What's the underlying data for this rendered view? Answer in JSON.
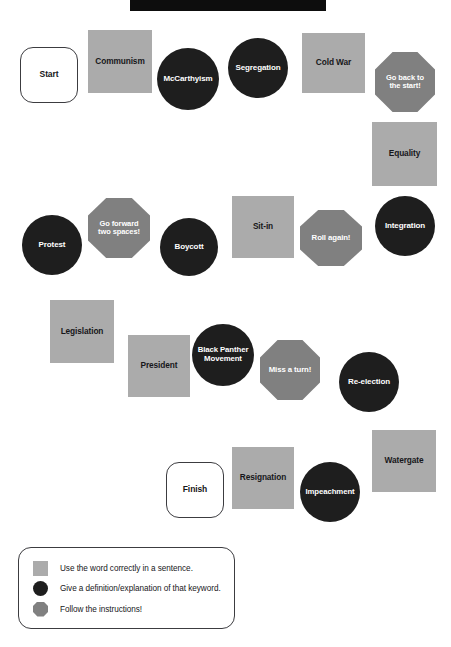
{
  "page": {
    "title_banner": {
      "name": "title-banner",
      "visible_text": ""
    },
    "background_color": "#ffffff"
  },
  "colors": {
    "square_fill": "#ababab",
    "circle_fill": "#1e1e1e",
    "octagon_fill": "#808080",
    "rounded_fill": "#ffffff",
    "outline": "#3c3c40",
    "banner": "#0d0d0d",
    "dark_text": "#17171a",
    "light_text": "#ffffff"
  },
  "board": {
    "spaces": [
      {
        "label": "Start",
        "shape": "rounded",
        "x": 20,
        "y": 47,
        "w": 58,
        "h": 56,
        "font": 8.5
      },
      {
        "label": "Communism",
        "shape": "square",
        "x": 88,
        "y": 30,
        "w": 64,
        "h": 63,
        "font": 8.3
      },
      {
        "label": "McCarthyism",
        "shape": "circle",
        "x": 157,
        "y": 48,
        "w": 62,
        "h": 62,
        "font": 8.0
      },
      {
        "label": "Segregation",
        "shape": "circle",
        "x": 228,
        "y": 38,
        "w": 60,
        "h": 60,
        "font": 8.0
      },
      {
        "label": "Cold War",
        "shape": "square",
        "x": 302,
        "y": 33,
        "w": 63,
        "h": 60,
        "font": 8.3
      },
      {
        "label": "Go back to\nthe start!",
        "shape": "octagon",
        "x": 375,
        "y": 52,
        "w": 60,
        "h": 60,
        "font": 7.5
      },
      {
        "label": "Equality",
        "shape": "square",
        "x": 372,
        "y": 122,
        "w": 65,
        "h": 64,
        "font": 8.3
      },
      {
        "label": "Integration",
        "shape": "circle",
        "x": 375,
        "y": 196,
        "w": 60,
        "h": 60,
        "font": 8.0
      },
      {
        "label": "Go forward\ntwo spaces!",
        "shape": "octagon",
        "x": 88,
        "y": 198,
        "w": 62,
        "h": 60,
        "font": 7.5
      },
      {
        "label": "Protest",
        "shape": "circle",
        "x": 22,
        "y": 215,
        "w": 60,
        "h": 60,
        "font": 8.0
      },
      {
        "label": "Boycott",
        "shape": "circle",
        "x": 160,
        "y": 218,
        "w": 58,
        "h": 58,
        "font": 8.0
      },
      {
        "label": "Sit-in",
        "shape": "square",
        "x": 232,
        "y": 196,
        "w": 62,
        "h": 62,
        "font": 8.3
      },
      {
        "label": "Roll again!",
        "shape": "octagon",
        "x": 300,
        "y": 210,
        "w": 62,
        "h": 56,
        "font": 7.8
      },
      {
        "label": "Legislation",
        "shape": "square",
        "x": 50,
        "y": 300,
        "w": 64,
        "h": 63,
        "font": 8.3
      },
      {
        "label": "President",
        "shape": "square",
        "x": 128,
        "y": 335,
        "w": 62,
        "h": 62,
        "font": 8.3
      },
      {
        "label": "Black Panther\nMovement",
        "shape": "circle",
        "x": 192,
        "y": 324,
        "w": 62,
        "h": 62,
        "font": 7.8
      },
      {
        "label": "Miss a turn!",
        "shape": "octagon",
        "x": 260,
        "y": 340,
        "w": 60,
        "h": 60,
        "font": 7.8
      },
      {
        "label": "Re-election",
        "shape": "circle",
        "x": 339,
        "y": 352,
        "w": 60,
        "h": 60,
        "font": 8.0
      },
      {
        "label": "Watergate",
        "shape": "square",
        "x": 372,
        "y": 430,
        "w": 64,
        "h": 62,
        "font": 8.3
      },
      {
        "label": "Impeachment",
        "shape": "circle",
        "x": 300,
        "y": 462,
        "w": 60,
        "h": 60,
        "font": 7.8
      },
      {
        "label": "Resignation",
        "shape": "square",
        "x": 232,
        "y": 447,
        "w": 62,
        "h": 62,
        "font": 8.3
      },
      {
        "label": "Finish",
        "shape": "rounded",
        "x": 166,
        "y": 462,
        "w": 58,
        "h": 56,
        "font": 8.5
      }
    ]
  },
  "legend": {
    "x": 18,
    "y": 547,
    "w": 217,
    "h": 82,
    "items": [
      {
        "swatch": "square",
        "text": "Use the word correctly in a sentence."
      },
      {
        "swatch": "circle",
        "text": "Give a definition/explanation of that keyword."
      },
      {
        "swatch": "octagon",
        "text": "Follow the instructions!"
      }
    ]
  }
}
